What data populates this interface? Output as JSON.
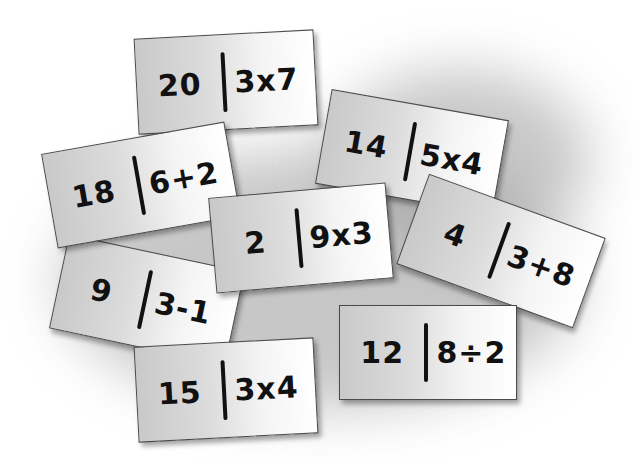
{
  "cards": [
    {
      "id": "c1",
      "left_value": "20",
      "right_expression": "3x7"
    },
    {
      "id": "c2",
      "left_value": "18",
      "right_expression": "6+2"
    },
    {
      "id": "c3",
      "left_value": "14",
      "right_expression": "5x4"
    },
    {
      "id": "c4",
      "left_value": "2",
      "right_expression": "9x3"
    },
    {
      "id": "c5",
      "left_value": "4",
      "right_expression": "3+8"
    },
    {
      "id": "c6",
      "left_value": "9",
      "right_expression": "3-1"
    },
    {
      "id": "c7",
      "left_value": "12",
      "right_expression": "8÷2"
    },
    {
      "id": "c8",
      "left_value": "15",
      "right_expression": "3x4"
    }
  ],
  "colors": {
    "background": "#ffffff",
    "card_border": "#4a4a4a",
    "ink": "#111111",
    "shadow": "#9a9a9a"
  }
}
